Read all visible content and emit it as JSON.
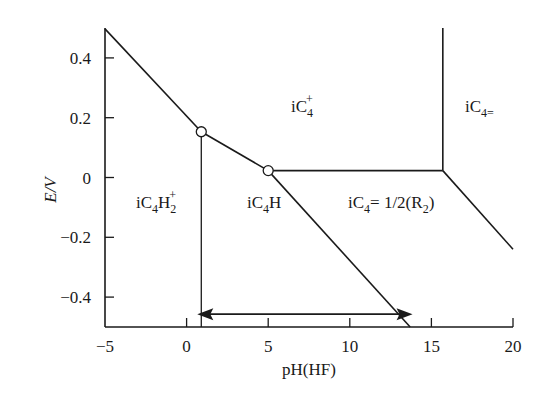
{
  "chart_data": {
    "type": "line",
    "title": "",
    "xlabel": "pH(HF)",
    "ylabel": "E/V",
    "xlim": [
      -5,
      20
    ],
    "ylim": [
      -0.5,
      0.5
    ],
    "grid": false,
    "legend": null,
    "x_ticks": [
      -5,
      0,
      5,
      10,
      15,
      20
    ],
    "x_tick_labels": [
      "−5",
      "0",
      "5",
      "10",
      "15",
      "20"
    ],
    "y_ticks": [
      0.4,
      0.2,
      0,
      -0.2,
      -0.4
    ],
    "y_tick_labels": [
      "0.4",
      "0.2",
      "0",
      "−0.2",
      "−0.4"
    ],
    "series": [
      {
        "name": "boundary iC4H2+ / iC4+",
        "x": [
          -5,
          0.9
        ],
        "y": [
          0.497,
          0.153
        ]
      },
      {
        "name": "boundary iC4H / iC4+",
        "x": [
          0.9,
          5.0
        ],
        "y": [
          0.153,
          0.023
        ]
      },
      {
        "name": "boundary iC4+ / iC4=1/2(R2)",
        "x": [
          5.0,
          15.7
        ],
        "y": [
          0.023,
          0.023
        ]
      },
      {
        "name": "boundary iC4+ / iC4=",
        "x": [
          15.7,
          15.7
        ],
        "y": [
          0.023,
          0.5
        ]
      },
      {
        "name": "boundary iC4= / iC4=1/2(R2)",
        "x": [
          15.7,
          20
        ],
        "y": [
          0.023,
          -0.24
        ]
      },
      {
        "name": "boundary iC4H / iC4=1/2(R2)",
        "x": [
          5.0,
          13.7
        ],
        "y": [
          0.023,
          -0.5
        ]
      },
      {
        "name": "boundary iC4H2+ / iC4H",
        "x": [
          0.9,
          0.9
        ],
        "y": [
          0.153,
          -0.5
        ]
      }
    ],
    "triple_points": [
      {
        "x": 0.9,
        "y": 0.153
      },
      {
        "x": 5.0,
        "y": 0.023
      }
    ],
    "annotations": [
      {
        "type": "double-arrow",
        "x_from": 0.9,
        "x_to": 13.6,
        "y": -0.457
      }
    ],
    "regions": [
      {
        "label": "iC4+",
        "x": 6.5,
        "y": 0.18
      },
      {
        "label": "iC4=",
        "x": 18,
        "y": 0.18
      },
      {
        "label": "iC4H2+",
        "x": -2,
        "y": -0.02
      },
      {
        "label": "iC4H",
        "x": 5,
        "y": -0.02
      },
      {
        "label": "iC4=1/2(R2)",
        "x": 13,
        "y": -0.02
      }
    ]
  },
  "labels": {
    "ylabel": "E/V",
    "xlabel": "pH(HF)",
    "region_iC4plus": {
      "base": "iC",
      "sub": "4",
      "sup": "+"
    },
    "region_iC4eq": {
      "base": "iC",
      "sub": "4="
    },
    "region_iC4H2plus": {
      "base": "iC",
      "sub1": "4",
      "mid": "H",
      "sub2": "2",
      "sup": "+"
    },
    "region_iC4H": {
      "base": "iC",
      "sub": "4",
      "tail": "H"
    },
    "region_iC4R2": {
      "base": "iC",
      "sub": "4",
      "mid": "= 1/2(R",
      "sub2": "2",
      "tail": ")"
    }
  }
}
